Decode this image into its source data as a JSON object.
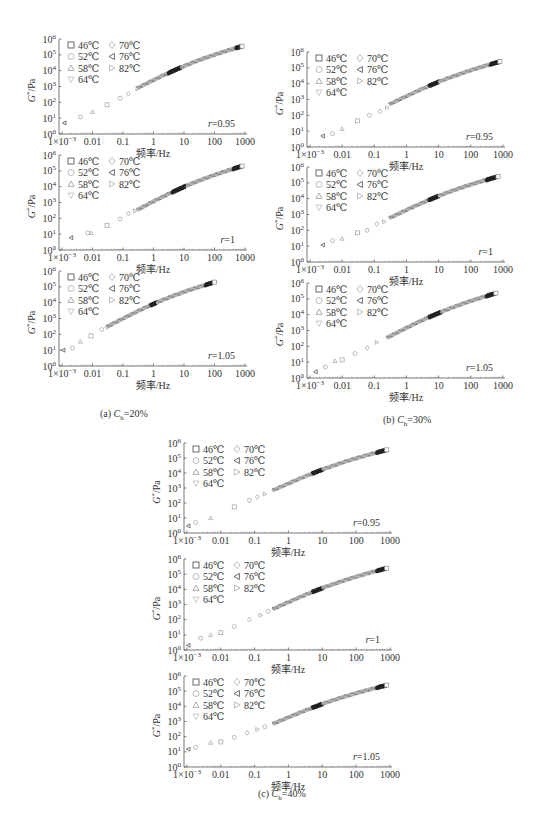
{
  "figure": {
    "captions": [
      {
        "id": "a",
        "prefix": "(a)",
        "var": "C",
        "sub": "h",
        "value": "=20%",
        "x": 100,
        "y": 408
      },
      {
        "id": "b",
        "prefix": "(b)",
        "var": "C",
        "sub": "h",
        "value": "=30%",
        "x": 383,
        "y": 414
      },
      {
        "id": "c",
        "prefix": "(c)",
        "var": "C",
        "sub": "h",
        "value": "=40%",
        "x": 258,
        "y": 788
      }
    ]
  },
  "chart_data": [
    {
      "id": "a1",
      "group": "a",
      "type": "scatter",
      "title": "",
      "xlabel": "频率/Hz",
      "ylabel": "G*/Pa",
      "xscale": "log",
      "yscale": "log",
      "xlim": [
        0.001,
        1000
      ],
      "ylim": [
        1,
        1000000
      ],
      "xticks": [
        "1×10⁻³",
        "0.01",
        "0.1",
        "1",
        "10",
        "100",
        "1000"
      ],
      "yticks": [
        "10⁰",
        "10¹",
        "10²",
        "10³",
        "10⁴",
        "10⁵",
        "10⁶"
      ],
      "annotation": "r=0.95",
      "legend": [
        "46℃",
        "52℃",
        "58℃",
        "64℃",
        "70℃",
        "76℃",
        "82℃"
      ],
      "series_points": [
        [
          0.0012,
          5
        ],
        [
          0.004,
          12
        ],
        [
          0.01,
          25
        ],
        [
          0.03,
          70
        ],
        [
          0.08,
          180
        ],
        [
          0.15,
          350
        ],
        [
          0.3,
          700
        ]
      ],
      "curve": {
        "x_start": 0.3,
        "y_start": 800,
        "x_end": 800,
        "y_end": 350000,
        "dark_segments": [
          [
            3,
            8
          ],
          [
            500,
            800
          ]
        ]
      },
      "layout": {
        "ax": 59,
        "top": 39,
        "bottom": 134,
        "right": 247
      }
    },
    {
      "id": "a2",
      "group": "a",
      "type": "scatter",
      "xlabel": "频率/Hz",
      "ylabel": "G*/Pa",
      "xscale": "log",
      "yscale": "log",
      "xlim": [
        0.001,
        1000
      ],
      "ylim": [
        1,
        1000000
      ],
      "xticks": [
        "1×10⁻³",
        "0.01",
        "0.1",
        "1",
        "10",
        "100",
        "1000"
      ],
      "yticks": [
        "10⁰",
        "10¹",
        "10²",
        "10³",
        "10⁴",
        "10⁵",
        "10⁶"
      ],
      "annotation": "r=1",
      "legend": [
        "46℃",
        "52℃",
        "58℃",
        "64℃",
        "70℃",
        "76℃",
        "82℃"
      ],
      "series_points": [
        [
          0.002,
          6
        ],
        [
          0.007,
          12
        ],
        [
          0.009,
          12
        ],
        [
          0.03,
          35
        ],
        [
          0.08,
          90
        ],
        [
          0.15,
          200
        ],
        [
          0.25,
          300
        ]
      ],
      "curve": {
        "x_start": 0.3,
        "y_start": 350,
        "x_end": 800,
        "y_end": 200000,
        "dark_segments": [
          [
            4,
            12
          ],
          [
            400,
            800
          ]
        ]
      },
      "layout": {
        "ax": 59,
        "top": 155,
        "bottom": 250,
        "right": 247
      }
    },
    {
      "id": "a3",
      "group": "a",
      "type": "scatter",
      "xlabel": "频率/Hz",
      "ylabel": "G*/Pa",
      "xscale": "log",
      "yscale": "log",
      "xlim": [
        0.001,
        1000
      ],
      "ylim": [
        1,
        1000000
      ],
      "xticks": [
        "1×10⁻³",
        "0.01",
        "0.1",
        "1",
        "10",
        "100",
        "1000"
      ],
      "yticks": [
        "10⁰",
        "10¹",
        "10²",
        "10³",
        "10⁴",
        "10⁵",
        "10⁶"
      ],
      "annotation": "r=1.05",
      "legend": [
        "46℃",
        "52℃",
        "58℃",
        "64℃",
        "70℃",
        "76℃",
        "82℃"
      ],
      "series_points": [
        [
          0.0011,
          10
        ],
        [
          0.0022,
          14
        ],
        [
          0.004,
          35
        ],
        [
          0.009,
          80
        ],
        [
          0.02,
          200
        ],
        [
          0.03,
          280
        ]
      ],
      "curve": {
        "x_start": 0.03,
        "y_start": 300,
        "x_end": 100,
        "y_end": 200000,
        "dark_segments": [
          [
            0.8,
            1.3
          ],
          [
            50,
            90
          ]
        ]
      },
      "layout": {
        "ax": 59,
        "top": 271,
        "bottom": 366,
        "right": 247
      }
    },
    {
      "id": "b1",
      "group": "b",
      "type": "scatter",
      "xlabel": "频率/Hz",
      "ylabel": "G*/Pa",
      "xscale": "log",
      "yscale": "log",
      "xlim": [
        0.001,
        1000
      ],
      "ylim": [
        1,
        1000000
      ],
      "xticks": [
        "1×10⁻³",
        "0.01",
        "0.1",
        "1",
        "10",
        "100",
        "1000"
      ],
      "yticks": [
        "10⁰",
        "10¹",
        "10²",
        "10³",
        "10⁴",
        "10⁵",
        "10⁶"
      ],
      "annotation": "r=0.95",
      "legend": [
        "46℃",
        "52℃",
        "58℃",
        "64℃",
        "70℃",
        "76℃",
        "82℃"
      ],
      "series_points": [
        [
          0.0025,
          5
        ],
        [
          0.005,
          7
        ],
        [
          0.01,
          14
        ],
        [
          0.03,
          45
        ],
        [
          0.07,
          100
        ],
        [
          0.15,
          180
        ],
        [
          0.25,
          300
        ]
      ],
      "curve": {
        "x_start": 0.3,
        "y_start": 500,
        "x_end": 800,
        "y_end": 250000,
        "dark_segments": [
          [
            5,
            10
          ],
          [
            400,
            800
          ]
        ]
      },
      "layout": {
        "ax": 307,
        "top": 52,
        "bottom": 147,
        "right": 505
      }
    },
    {
      "id": "b2",
      "group": "b",
      "type": "scatter",
      "xlabel": "频率/Hz",
      "ylabel": "G*/Pa",
      "xscale": "log",
      "yscale": "log",
      "xlim": [
        0.001,
        1000
      ],
      "ylim": [
        1,
        1000000
      ],
      "xticks": [
        "1×10⁻³",
        "0.01",
        "0.1",
        "1",
        "10",
        "100",
        "1000"
      ],
      "yticks": [
        "10⁰",
        "10¹",
        "10²",
        "10³",
        "10⁴",
        "10⁵",
        "10⁶"
      ],
      "annotation": "r=1",
      "legend": [
        "46℃",
        "52℃",
        "58℃",
        "64℃",
        "70℃",
        "76℃",
        "82℃"
      ],
      "series_points": [
        [
          0.0025,
          12
        ],
        [
          0.005,
          22
        ],
        [
          0.01,
          30
        ],
        [
          0.03,
          70
        ],
        [
          0.06,
          100
        ],
        [
          0.12,
          250
        ],
        [
          0.2,
          350
        ]
      ],
      "curve": {
        "x_start": 0.3,
        "y_start": 600,
        "x_end": 700,
        "y_end": 250000,
        "dark_segments": [
          [
            5,
            10
          ],
          [
            300,
            700
          ]
        ]
      },
      "layout": {
        "ax": 307,
        "top": 167,
        "bottom": 262,
        "right": 505
      }
    },
    {
      "id": "b3",
      "group": "b",
      "type": "scatter",
      "xlabel": "频率/Hz",
      "ylabel": "G*/Pa",
      "xscale": "log",
      "yscale": "log",
      "xlim": [
        0.001,
        1000
      ],
      "ylim": [
        1,
        1000000
      ],
      "xticks": [
        "1×10⁻³",
        "0.01",
        "0.1",
        "1",
        "10",
        "100",
        "1000"
      ],
      "yticks": [
        "10⁰",
        "10¹",
        "10²",
        "10³",
        "10⁴",
        "10⁵",
        "10⁶"
      ],
      "annotation": "r=1.05",
      "legend": [
        "46℃",
        "52℃",
        "58℃",
        "64℃",
        "70℃",
        "76℃",
        "82℃"
      ],
      "series_points": [
        [
          0.0015,
          2.5
        ],
        [
          0.003,
          5
        ],
        [
          0.006,
          12
        ],
        [
          0.01,
          14
        ],
        [
          0.025,
          35
        ],
        [
          0.06,
          80
        ],
        [
          0.12,
          180
        ]
      ],
      "curve": {
        "x_start": 0.25,
        "y_start": 350,
        "x_end": 600,
        "y_end": 230000,
        "dark_segments": [
          [
            5,
            12
          ],
          [
            300,
            600
          ]
        ]
      },
      "layout": {
        "ax": 307,
        "top": 283,
        "bottom": 378,
        "right": 505
      }
    },
    {
      "id": "c1",
      "group": "c",
      "type": "scatter",
      "xlabel": "频率/Hz",
      "ylabel": "G*/Pa",
      "xscale": "log",
      "yscale": "log",
      "xlim": [
        0.001,
        1000
      ],
      "ylim": [
        1,
        1000000
      ],
      "xticks": [
        "1×10⁻³",
        "0.01",
        "0.1",
        "1",
        "10",
        "100",
        "1000"
      ],
      "yticks": [
        "10⁰",
        "10¹",
        "10²",
        "10³",
        "10⁴",
        "10⁵",
        "10⁶"
      ],
      "annotation": "r=0.95",
      "legend": [
        "46℃",
        "52℃",
        "58℃",
        "64℃",
        "70℃",
        "76℃",
        "82℃"
      ],
      "series_points": [
        [
          0.0011,
          3
        ],
        [
          0.0018,
          5
        ],
        [
          0.005,
          10
        ],
        [
          0.025,
          55
        ],
        [
          0.07,
          150
        ],
        [
          0.12,
          250
        ],
        [
          0.2,
          400
        ]
      ],
      "curve": {
        "x_start": 0.35,
        "y_start": 700,
        "x_end": 800,
        "y_end": 350000,
        "dark_segments": [
          [
            5,
            10
          ],
          [
            400,
            800
          ]
        ]
      },
      "layout": {
        "ax": 184,
        "top": 443,
        "bottom": 533,
        "right": 392
      }
    },
    {
      "id": "c2",
      "group": "c",
      "type": "scatter",
      "xlabel": "频率/Hz",
      "ylabel": "G*/Pa",
      "xscale": "log",
      "yscale": "log",
      "xlim": [
        0.001,
        1000
      ],
      "ylim": [
        1,
        1000000
      ],
      "xticks": [
        "1×10⁻³",
        "0.01",
        "0.1",
        "1",
        "10",
        "100",
        "1000"
      ],
      "yticks": [
        "10⁰",
        "10¹",
        "10²",
        "10³",
        "10⁴",
        "10⁵",
        "10⁶"
      ],
      "annotation": "r=1",
      "legend": [
        "46℃",
        "52℃",
        "58℃",
        "64℃",
        "70℃",
        "76℃",
        "82℃"
      ],
      "series_points": [
        [
          0.0011,
          2
        ],
        [
          0.0025,
          6
        ],
        [
          0.005,
          10
        ],
        [
          0.01,
          14
        ],
        [
          0.025,
          35
        ],
        [
          0.07,
          100
        ],
        [
          0.15,
          200
        ],
        [
          0.25,
          350
        ]
      ],
      "curve": {
        "x_start": 0.35,
        "y_start": 500,
        "x_end": 800,
        "y_end": 250000,
        "dark_segments": [
          [
            5,
            10
          ],
          [
            400,
            800
          ]
        ]
      },
      "layout": {
        "ax": 184,
        "top": 559,
        "bottom": 650,
        "right": 392
      }
    },
    {
      "id": "c3",
      "group": "c",
      "type": "scatter",
      "xlabel": "频率/Hz",
      "ylabel": "G*/Pa",
      "xscale": "log",
      "yscale": "log",
      "xlim": [
        0.001,
        1000
      ],
      "ylim": [
        1,
        1000000
      ],
      "xticks": [
        "1×10⁻³",
        "0.01",
        "0.1",
        "1",
        "10",
        "100",
        "1000"
      ],
      "yticks": [
        "10⁰",
        "10¹",
        "10²",
        "10³",
        "10⁴",
        "10⁵",
        "10⁶"
      ],
      "annotation": "r=1.05",
      "legend": [
        "46℃",
        "52℃",
        "58℃",
        "64℃",
        "70℃",
        "76℃",
        "82℃"
      ],
      "series_points": [
        [
          0.0011,
          15
        ],
        [
          0.0018,
          20
        ],
        [
          0.005,
          40
        ],
        [
          0.01,
          45
        ],
        [
          0.025,
          90
        ],
        [
          0.06,
          180
        ],
        [
          0.12,
          300
        ],
        [
          0.2,
          450
        ]
      ],
      "curve": {
        "x_start": 0.35,
        "y_start": 700,
        "x_end": 800,
        "y_end": 250000,
        "dark_segments": [
          [
            5,
            10
          ],
          [
            400,
            800
          ]
        ]
      },
      "layout": {
        "ax": 184,
        "top": 676,
        "bottom": 767,
        "right": 392
      }
    }
  ]
}
